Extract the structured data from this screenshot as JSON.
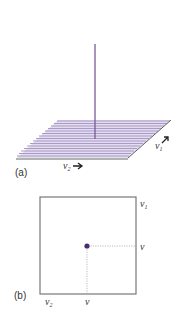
{
  "panel_a": {
    "label": "(a)",
    "axis_v1": {
      "name": "v",
      "sub": "1"
    },
    "axis_v2": {
      "name": "v",
      "sub": "2"
    },
    "colors": {
      "stripes": "#a99ac8",
      "stripe_alt": "#d8d0e8",
      "spike": "#7a5a9a",
      "edge": "#555555"
    }
  },
  "panel_b": {
    "label": "(b)",
    "axis_v1": {
      "name": "v",
      "sub": "1"
    },
    "axis_v2": {
      "name": "v",
      "sub": "2"
    },
    "point_label_right": "v",
    "point_label_bottom": "v",
    "colors": {
      "point": "#4b2a6e",
      "frame": "#777777",
      "guide": "#aaaaaa"
    }
  }
}
